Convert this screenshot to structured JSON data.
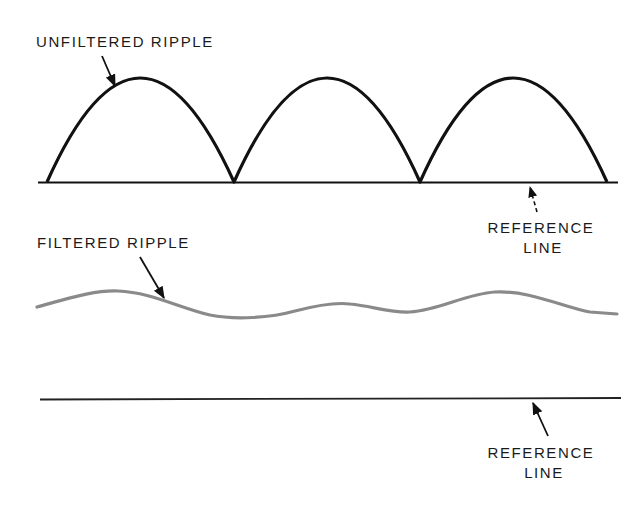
{
  "diagram": {
    "top_panel": {
      "label": "UNFILTERED RIPPLE",
      "reference_label_line1": "REFERENCE",
      "reference_label_line2": "LINE",
      "waveform": "full-wave rectified (3 half-sine arches)",
      "stroke_color": "#111111"
    },
    "middle_panel": {
      "label": "FILTERED RIPPLE",
      "waveform": "small undulating wave",
      "stroke_color": "#8a8a8a"
    },
    "bottom_panel": {
      "reference_label_line1": "REFERENCE",
      "reference_label_line2": "LINE",
      "stroke_color": "#222222"
    }
  }
}
